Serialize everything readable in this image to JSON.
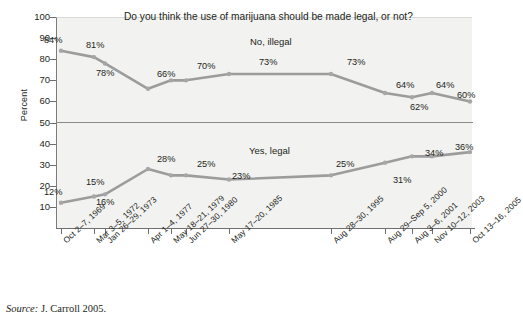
{
  "chart_data": {
    "type": "line",
    "title": "Do you think the use of marijuana should be made legal, or not?",
    "xlabel": "",
    "ylabel": "Percent",
    "ylim": [
      0,
      100
    ],
    "yticks": [
      100,
      90,
      80,
      70,
      60,
      50,
      40,
      30,
      20,
      10
    ],
    "grid": false,
    "legend_position": "inline-annotation",
    "categories": [
      "Oct 2–7, 1969",
      "Mar 3–5, 1972",
      "Jan 26–29, 1973",
      "Apr 1–4, 1977",
      "May 18–21, 1979",
      "Jun 27–30, 1980",
      "May 17–20, 1985",
      "Aug 28–30, 1995",
      "Aug 29–Sep 5, 2000",
      "Aug 3–6, 2001",
      "Nov 10–12, 2003",
      "Oct 13–16, 2005"
    ],
    "series": [
      {
        "name": "No, illegal",
        "values": [
          84,
          81,
          78,
          66,
          70,
          70,
          73,
          73,
          64,
          62,
          64,
          60
        ],
        "labels": [
          "84%",
          "81%",
          "78%",
          "66%",
          "70%",
          "",
          "73%",
          "73%",
          "64%",
          "62%",
          "64%",
          "60%"
        ]
      },
      {
        "name": "Yes, legal",
        "values": [
          12,
          15,
          16,
          28,
          25,
          25,
          23,
          25,
          31,
          34,
          34,
          36
        ],
        "labels": [
          "12%",
          "15%",
          "16%",
          "28%",
          "25%",
          "",
          "23%",
          "25%",
          "31%",
          "34%",
          "",
          "36%"
        ]
      }
    ],
    "annotations": [
      "No, illegal",
      "Yes, legal"
    ],
    "series_color": "#9c9c9c",
    "plot_background": "#f2f2f0",
    "source": "Source: J. Carroll 2005.",
    "source_prefix": "Source:",
    "source_body": "J. Carroll 2005."
  },
  "yticks_labels": [
    "100",
    "90",
    "80",
    "70",
    "60",
    "50",
    "40",
    "30",
    "20",
    "10"
  ],
  "data_labels_upper": [
    {
      "text": "84%",
      "x": 44,
      "y": 36
    },
    {
      "text": "81%",
      "x": 86,
      "y": 41
    },
    {
      "text": "78%",
      "x": 96,
      "y": 69
    },
    {
      "text": "66%",
      "x": 157,
      "y": 70
    },
    {
      "text": "70%",
      "x": 197,
      "y": 62
    },
    {
      "text": "73%",
      "x": 259,
      "y": 58
    },
    {
      "text": "73%",
      "x": 347,
      "y": 58
    },
    {
      "text": "64%",
      "x": 396,
      "y": 81
    },
    {
      "text": "62%",
      "x": 410,
      "y": 103
    },
    {
      "text": "64%",
      "x": 436,
      "y": 81
    },
    {
      "text": "60%",
      "x": 457,
      "y": 91
    }
  ],
  "data_labels_lower": [
    {
      "text": "12%",
      "x": 44,
      "y": 188
    },
    {
      "text": "15%",
      "x": 86,
      "y": 178
    },
    {
      "text": "16%",
      "x": 96,
      "y": 198
    },
    {
      "text": "28%",
      "x": 157,
      "y": 155
    },
    {
      "text": "25%",
      "x": 197,
      "y": 160
    },
    {
      "text": "23%",
      "x": 232,
      "y": 172
    },
    {
      "text": "25%",
      "x": 336,
      "y": 160
    },
    {
      "text": "31%",
      "x": 393,
      "y": 176
    },
    {
      "text": "34%",
      "x": 425,
      "y": 149
    },
    {
      "text": "36%",
      "x": 455,
      "y": 143
    }
  ]
}
